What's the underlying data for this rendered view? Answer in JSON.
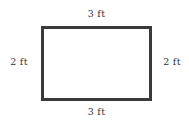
{
  "figure": {
    "shape_name": "rectangle",
    "stroke_color": "#3a3a3a",
    "fill_color": "#ffffff",
    "background_color": "#ffffff"
  },
  "labels": {
    "top": "3 ft",
    "bottom": "3 ft",
    "left": "2 ft",
    "right": "2 ft"
  },
  "chart_data": {
    "type": "diagram",
    "title": "",
    "shape": "rectangle",
    "units": "ft",
    "sides": [
      {
        "position": "top",
        "length": 3,
        "label": "3 ft"
      },
      {
        "position": "right",
        "length": 2,
        "label": "2 ft"
      },
      {
        "position": "bottom",
        "length": 3,
        "label": "3 ft"
      },
      {
        "position": "left",
        "length": 2,
        "label": "2 ft"
      }
    ],
    "width": 3,
    "height": 2,
    "perimeter": 10,
    "area": 6
  }
}
